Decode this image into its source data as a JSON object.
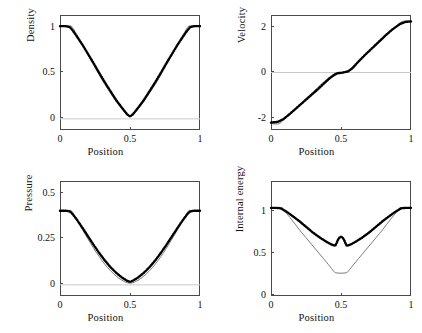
{
  "figure": {
    "background": "#ffffff",
    "axis_color": "#4a4a4a",
    "zero_line_color": "#c9c9c9",
    "exact_color": "#5a5a5a",
    "numeric_color": "#000000"
  },
  "chart_data": [
    {
      "type": "line",
      "panel": "density",
      "title": "",
      "xlabel": "Position",
      "ylabel": "Density",
      "xlim": [
        0,
        1
      ],
      "ylim": [
        -0.12,
        1.12
      ],
      "xticks": [
        0,
        0.5,
        1
      ],
      "xticklabels": [
        "0",
        "0.5",
        "1"
      ],
      "yticks": [
        0,
        0.5,
        1
      ],
      "yticklabels": [
        "0",
        "0.5",
        "1"
      ],
      "grid": false,
      "zero_line": 0,
      "legend": "none",
      "series": [
        {
          "name": "exact",
          "style": "thin-line",
          "x": [
            0.0,
            0.05,
            0.08,
            0.1,
            0.14,
            0.18,
            0.22,
            0.26,
            0.3,
            0.34,
            0.38,
            0.42,
            0.46,
            0.5,
            0.54,
            0.58,
            0.62,
            0.66,
            0.7,
            0.74,
            0.78,
            0.82,
            0.86,
            0.9,
            0.92,
            0.95,
            1.0
          ],
          "y": [
            1.0,
            1.0,
            1.0,
            0.96,
            0.855,
            0.745,
            0.635,
            0.53,
            0.42,
            0.325,
            0.235,
            0.15,
            0.075,
            0.022,
            0.075,
            0.15,
            0.235,
            0.325,
            0.42,
            0.53,
            0.635,
            0.745,
            0.855,
            0.96,
            1.0,
            1.0,
            1.0
          ]
        },
        {
          "name": "numerical",
          "style": "thick-dotted",
          "x": [
            0.0,
            0.04,
            0.07,
            0.09,
            0.12,
            0.16,
            0.2,
            0.24,
            0.28,
            0.32,
            0.36,
            0.4,
            0.44,
            0.48,
            0.5,
            0.52,
            0.56,
            0.6,
            0.64,
            0.68,
            0.72,
            0.76,
            0.8,
            0.84,
            0.88,
            0.91,
            0.93,
            0.96,
            1.0
          ],
          "y": [
            1.0,
            1.0,
            0.99,
            0.955,
            0.89,
            0.8,
            0.7,
            0.6,
            0.495,
            0.395,
            0.3,
            0.205,
            0.125,
            0.048,
            0.028,
            0.048,
            0.125,
            0.205,
            0.3,
            0.395,
            0.495,
            0.6,
            0.7,
            0.8,
            0.89,
            0.955,
            0.99,
            1.0,
            1.0
          ]
        }
      ]
    },
    {
      "type": "line",
      "panel": "velocity",
      "title": "",
      "xlabel": "Position",
      "ylabel": "Velocity",
      "xlim": [
        0,
        1
      ],
      "ylim": [
        -2.25,
        2.25
      ],
      "xticks": [
        0,
        0.5,
        1
      ],
      "xticklabels": [
        "0",
        "0.5",
        "1"
      ],
      "yticks": [
        -2,
        0,
        2
      ],
      "yticklabels": [
        "-2",
        "0",
        "2"
      ],
      "grid": false,
      "zero_line": 0,
      "legend": "none",
      "series": [
        {
          "name": "exact",
          "style": "thin-line",
          "x": [
            0.0,
            0.06,
            0.1,
            0.15,
            0.2,
            0.25,
            0.3,
            0.35,
            0.4,
            0.45,
            0.48,
            0.5,
            0.52,
            0.55,
            0.6,
            0.65,
            0.7,
            0.75,
            0.8,
            0.85,
            0.9,
            0.94,
            1.0
          ],
          "y": [
            -2.0,
            -2.0,
            -1.78,
            -1.55,
            -1.28,
            -1.02,
            -0.76,
            -0.5,
            -0.26,
            -0.06,
            0.0,
            0.0,
            0.0,
            0.08,
            0.3,
            0.56,
            0.82,
            1.06,
            1.32,
            1.58,
            1.84,
            2.0,
            2.0
          ]
        },
        {
          "name": "numerical",
          "style": "thick-dotted",
          "x": [
            0.0,
            0.05,
            0.09,
            0.13,
            0.18,
            0.23,
            0.28,
            0.33,
            0.38,
            0.42,
            0.45,
            0.47,
            0.485,
            0.5,
            0.515,
            0.53,
            0.55,
            0.58,
            0.62,
            0.67,
            0.72,
            0.77,
            0.82,
            0.87,
            0.92,
            0.96,
            1.0
          ],
          "y": [
            -1.96,
            -1.93,
            -1.82,
            -1.64,
            -1.4,
            -1.16,
            -0.92,
            -0.68,
            -0.42,
            -0.22,
            -0.1,
            -0.04,
            -0.02,
            -0.015,
            0.0,
            0.02,
            0.04,
            0.16,
            0.4,
            0.68,
            0.94,
            1.2,
            1.46,
            1.7,
            1.89,
            1.98,
            2.0
          ]
        }
      ]
    },
    {
      "type": "line",
      "panel": "pressure",
      "title": "",
      "xlabel": "Position",
      "ylabel": "Pressure",
      "xlim": [
        0,
        1
      ],
      "ylim": [
        -0.06,
        0.56
      ],
      "xticks": [
        0,
        0.5,
        1
      ],
      "xticklabels": [
        "0",
        "0.5",
        "1"
      ],
      "yticks": [
        0,
        0.25,
        0.5
      ],
      "yticklabels": [
        "0",
        "0.25",
        "0.5"
      ],
      "grid": false,
      "zero_line": 0,
      "legend": "none",
      "series": [
        {
          "name": "exact",
          "style": "thin-line",
          "x": [
            0.0,
            0.05,
            0.08,
            0.1,
            0.14,
            0.18,
            0.22,
            0.26,
            0.3,
            0.34,
            0.38,
            0.42,
            0.46,
            0.5,
            0.54,
            0.58,
            0.62,
            0.66,
            0.7,
            0.74,
            0.78,
            0.82,
            0.86,
            0.9,
            0.92,
            0.95,
            1.0
          ],
          "y": [
            0.4,
            0.4,
            0.4,
            0.378,
            0.325,
            0.272,
            0.222,
            0.174,
            0.131,
            0.093,
            0.062,
            0.036,
            0.018,
            0.009,
            0.018,
            0.036,
            0.062,
            0.093,
            0.131,
            0.174,
            0.222,
            0.272,
            0.325,
            0.378,
            0.4,
            0.4,
            0.4
          ]
        },
        {
          "name": "numerical",
          "style": "thick-dotted",
          "x": [
            0.0,
            0.04,
            0.07,
            0.09,
            0.12,
            0.16,
            0.2,
            0.24,
            0.28,
            0.32,
            0.36,
            0.4,
            0.44,
            0.48,
            0.5,
            0.52,
            0.56,
            0.6,
            0.64,
            0.68,
            0.72,
            0.76,
            0.8,
            0.84,
            0.88,
            0.91,
            0.93,
            0.96,
            1.0
          ],
          "y": [
            0.4,
            0.4,
            0.396,
            0.382,
            0.352,
            0.308,
            0.262,
            0.216,
            0.172,
            0.132,
            0.096,
            0.066,
            0.041,
            0.022,
            0.016,
            0.022,
            0.041,
            0.066,
            0.096,
            0.132,
            0.172,
            0.216,
            0.262,
            0.308,
            0.352,
            0.382,
            0.396,
            0.4,
            0.4
          ]
        }
      ]
    },
    {
      "type": "line",
      "panel": "internal-energy",
      "title": "",
      "xlabel": "Position",
      "ylabel": "Internal energy",
      "xlim": [
        0,
        1
      ],
      "ylim": [
        -0.05,
        1.32
      ],
      "xticks": [
        0,
        0.5,
        1
      ],
      "xticklabels": [
        "0",
        "0.5",
        "1"
      ],
      "yticks": [
        0,
        0.5,
        1
      ],
      "yticklabels": [
        "0",
        "0.5",
        "1"
      ],
      "grid": false,
      "zero_line": null,
      "legend": "none",
      "series": [
        {
          "name": "exact",
          "style": "thin-line",
          "x": [
            0.0,
            0.05,
            0.08,
            0.1,
            0.15,
            0.2,
            0.25,
            0.3,
            0.35,
            0.4,
            0.44,
            0.46,
            0.5,
            0.54,
            0.56,
            0.6,
            0.65,
            0.7,
            0.75,
            0.8,
            0.85,
            0.9,
            0.92,
            0.95,
            1.0
          ],
          "y": [
            1.0,
            1.0,
            1.0,
            0.955,
            0.855,
            0.745,
            0.645,
            0.545,
            0.445,
            0.345,
            0.262,
            0.228,
            0.222,
            0.228,
            0.262,
            0.345,
            0.445,
            0.545,
            0.645,
            0.745,
            0.855,
            0.955,
            1.0,
            1.0,
            1.0
          ]
        },
        {
          "name": "numerical",
          "style": "thick-dotted",
          "x": [
            0.0,
            0.04,
            0.07,
            0.09,
            0.12,
            0.16,
            0.2,
            0.25,
            0.3,
            0.35,
            0.4,
            0.43,
            0.45,
            0.46,
            0.47,
            0.48,
            0.49,
            0.5,
            0.51,
            0.52,
            0.53,
            0.54,
            0.55,
            0.57,
            0.6,
            0.65,
            0.7,
            0.75,
            0.8,
            0.84,
            0.88,
            0.91,
            0.93,
            0.96,
            1.0
          ],
          "y": [
            1.0,
            1.0,
            0.995,
            0.975,
            0.945,
            0.895,
            0.845,
            0.775,
            0.705,
            0.645,
            0.592,
            0.565,
            0.552,
            0.552,
            0.585,
            0.625,
            0.648,
            0.655,
            0.648,
            0.625,
            0.585,
            0.552,
            0.552,
            0.565,
            0.592,
            0.645,
            0.705,
            0.775,
            0.845,
            0.895,
            0.945,
            0.975,
            0.995,
            1.0,
            1.0
          ]
        }
      ]
    }
  ]
}
